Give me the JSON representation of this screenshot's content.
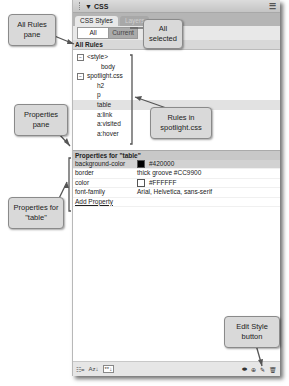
{
  "panel": {
    "title": "CSS",
    "menu_icon": "panel-options-icon",
    "tabs": [
      {
        "label": "CSS Styles",
        "active": true
      },
      {
        "label": "Layers",
        "active": false
      }
    ],
    "mode_toggle": {
      "all_label": "All",
      "current_label": "Current",
      "selected": "All"
    },
    "all_rules_heading": "All Rules",
    "rules": [
      {
        "label": "<style>",
        "level": 0,
        "expandable": true,
        "expand_glyph": "⊟"
      },
      {
        "label": "body",
        "level": 1
      },
      {
        "label": "spotlight.css",
        "level": 0,
        "expandable": true,
        "expand_glyph": "⊟"
      },
      {
        "label": "h2",
        "level": 1
      },
      {
        "label": "p",
        "level": 1
      },
      {
        "label": "table",
        "level": 1,
        "selected": true
      },
      {
        "label": "a:link",
        "level": 1
      },
      {
        "label": "a:visited",
        "level": 1
      },
      {
        "label": "a:hover",
        "level": 1
      }
    ],
    "properties_heading": "Properties for \"table\"",
    "properties": [
      {
        "name": "background-color",
        "value": "#420000",
        "swatch": "#000000",
        "selected": true
      },
      {
        "name": "border",
        "value": "thick groove #CC9900"
      },
      {
        "name": "color",
        "value": "#FFFFFF",
        "swatch": "#FFFFFF"
      },
      {
        "name": "font-family",
        "value": "Arial, Helvetica, sans-serif"
      }
    ],
    "add_property_label": "Add Property",
    "bottom_toolbar": {
      "left_icons": [
        "category-view-icon",
        "alphabetical-view-icon",
        "set-properties-view-icon"
      ],
      "left_glyphs": [
        "☷=",
        "Az↓",
        "**↓"
      ],
      "right_icons": [
        "attach-stylesheet-icon",
        "new-css-rule-icon",
        "edit-style-icon",
        "delete-css-rule-icon"
      ],
      "right_glyphs": [
        "⬬",
        "⊕",
        "✎",
        "🗑"
      ]
    }
  },
  "callouts": {
    "all_rules_pane": "All Rules pane",
    "all_selected": "All selected",
    "rules_in_spotlight": "Rules in spotlight.css",
    "properties_pane": "Properties pane",
    "properties_for_table": "Properties for \"table\"",
    "edit_style_button": "Edit Style button"
  }
}
